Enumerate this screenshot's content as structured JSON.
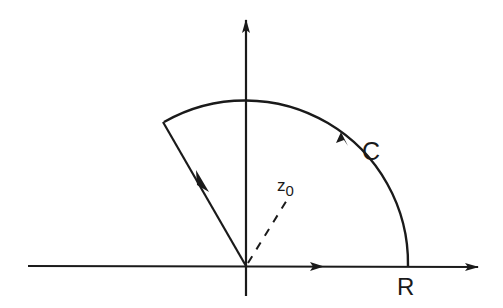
{
  "diagram": {
    "type": "contour-in-complex-plane",
    "labels": {
      "contour": "C",
      "radius": "R",
      "point": "z",
      "point_subscript": "0"
    },
    "geometry": {
      "origin": [
        246,
        266
      ],
      "radius_px": 163,
      "sector_start_angle_deg": 0,
      "sector_end_angle_deg": 120
    },
    "colors": {
      "stroke": "#1a1a1a",
      "background": "#ffffff"
    }
  }
}
